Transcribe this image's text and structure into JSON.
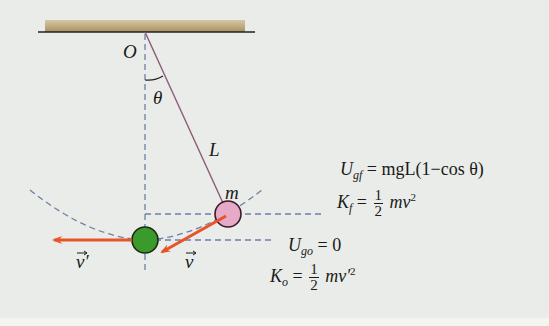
{
  "diagram": {
    "labels": {
      "pivot": "O",
      "angle": "θ",
      "length": "L",
      "mass": "m",
      "velocity_top": "v",
      "velocity_bottom": "v′"
    },
    "equations": {
      "ugf": {
        "lhs": "U",
        "sub": "gf",
        "rhs": "= mgL(1−cos θ)"
      },
      "kf": {
        "lhs": "K",
        "sub": "f",
        "eq": "=",
        "num": "1",
        "den": "2",
        "rhs": "mv",
        "sup": "2"
      },
      "ugo": {
        "lhs": "U",
        "sub": "go",
        "rhs": "= 0"
      },
      "ko": {
        "lhs": "K",
        "sub": "o",
        "eq": "=",
        "num": "1",
        "den": "2",
        "rhs": "mv′",
        "sup": "2"
      }
    },
    "colors": {
      "background": "#e9ece8",
      "ceiling": "#b9a27a",
      "string": "#8a5b7a",
      "dashed": "#6f7fa6",
      "pink_ball": "#e7a9c8",
      "green_ball": "#3a9a2c",
      "arrow": "#e8532a"
    }
  }
}
